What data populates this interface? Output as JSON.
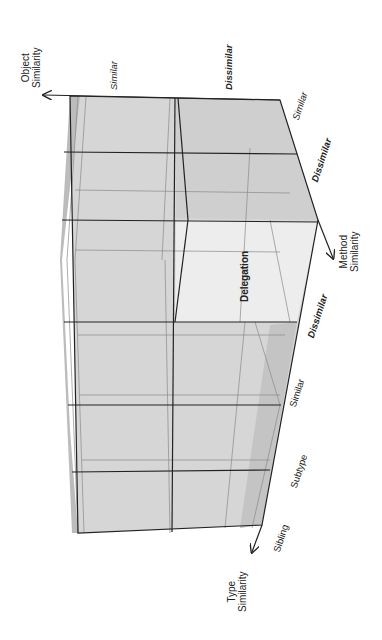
{
  "diagram": {
    "type": "3d-cube-classification",
    "axes": {
      "object": {
        "title_line1": "Object",
        "title_line2": "Similarity",
        "values": [
          "Similar",
          "Dissimilar"
        ]
      },
      "method": {
        "title_line1": "Method",
        "title_line2": "Similarity",
        "values": [
          "Similar",
          "Dissimilar"
        ]
      },
      "type": {
        "title_line1": "Type",
        "title_line2": "Similarity",
        "values": [
          "Sibling",
          "Subtype",
          "Similar",
          "Dissimilar"
        ]
      }
    },
    "highlighted_cell": {
      "label": "Delegation"
    },
    "colors": {
      "face": "#d4d4d4",
      "face_light": "#ececec",
      "face_dark": "#bdbdbd",
      "edge": "#222222",
      "inner_edge": "#8a8a8a"
    }
  }
}
